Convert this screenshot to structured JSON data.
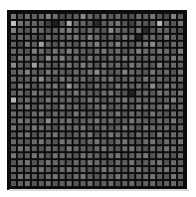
{
  "chart_data": {
    "type": "heatmap",
    "title": "",
    "xlabel": "",
    "ylabel": "",
    "rows": 25,
    "cols": 25,
    "value_range": [
      0,
      1
    ],
    "colormap": "grayscale",
    "background_color": "#0c0c0c",
    "values": [
      [
        0.45,
        0.3,
        0.4,
        0.35,
        0.38,
        0.5,
        0.42,
        0.25,
        0.3,
        0.35,
        0.55,
        0.4,
        0.3,
        0.45,
        0.32,
        0.38,
        0.3,
        0.28,
        0.4,
        0.35,
        0.45,
        0.3,
        0.25,
        0.5,
        0.35
      ],
      [
        0.8,
        0.45,
        0.4,
        0.38,
        0.35,
        0.2,
        0.05,
        0.3,
        0.7,
        0.4,
        0.38,
        0.3,
        0.1,
        0.35,
        0.4,
        0.45,
        0.3,
        0.2,
        0.4,
        0.3,
        0.35,
        0.75,
        0.4,
        0.3,
        0.45
      ],
      [
        0.5,
        0.35,
        0.3,
        0.45,
        0.4,
        0.3,
        0.35,
        0.45,
        0.5,
        0.38,
        0.3,
        0.4,
        0.35,
        0.3,
        0.55,
        0.4,
        0.35,
        0.3,
        0.45,
        0.1,
        0.3,
        0.4,
        0.35,
        0.3,
        0.25
      ],
      [
        0.3,
        0.4,
        0.35,
        0.3,
        0.25,
        0.4,
        0.3,
        0.35,
        0.4,
        0.45,
        0.35,
        0.5,
        0.4,
        0.3,
        0.35,
        0.3,
        0.45,
        0.4,
        0.05,
        0.35,
        0.4,
        0.3,
        0.45,
        0.35,
        0.3
      ],
      [
        0.35,
        0.25,
        0.45,
        0.35,
        0.65,
        0.35,
        0.3,
        0.4,
        0.35,
        0.3,
        0.45,
        0.4,
        0.5,
        0.35,
        0.4,
        0.5,
        0.35,
        0.3,
        0.4,
        0.45,
        0.55,
        0.35,
        0.3,
        0.4,
        0.35
      ],
      [
        0.4,
        0.35,
        0.3,
        0.5,
        0.4,
        0.3,
        0.45,
        0.35,
        0.5,
        0.4,
        0.35,
        0.3,
        0.4,
        0.45,
        0.35,
        0.4,
        0.3,
        0.35,
        0.5,
        0.4,
        0.35,
        0.45,
        0.4,
        0.3,
        0.5
      ],
      [
        0.3,
        0.45,
        0.4,
        0.35,
        0.3,
        0.55,
        0.4,
        0.5,
        0.35,
        0.4,
        0.3,
        0.45,
        0.35,
        0.3,
        0.4,
        0.35,
        0.45,
        0.4,
        0.3,
        0.35,
        0.4,
        0.3,
        0.35,
        0.45,
        0.4
      ],
      [
        0.55,
        0.35,
        0.3,
        0.65,
        0.4,
        0.35,
        0.3,
        0.4,
        0.45,
        0.35,
        0.5,
        0.4,
        0.3,
        0.45,
        0.35,
        0.4,
        0.3,
        0.45,
        0.4,
        0.35,
        0.3,
        0.5,
        0.35,
        0.4,
        0.35
      ],
      [
        0.35,
        0.4,
        0.5,
        0.35,
        0.3,
        0.45,
        0.4,
        0.35,
        0.3,
        0.4,
        0.35,
        0.45,
        0.55,
        0.4,
        0.3,
        0.35,
        0.5,
        0.4,
        0.35,
        0.3,
        0.45,
        0.35,
        0.4,
        0.3,
        0.45
      ],
      [
        0.4,
        0.3,
        0.35,
        0.4,
        0.55,
        0.35,
        0.3,
        0.45,
        0.4,
        0.35,
        0.4,
        0.3,
        0.35,
        0.4,
        0.45,
        0.3,
        0.35,
        0.4,
        0.3,
        0.45,
        0.35,
        0.4,
        0.3,
        0.35,
        0.4
      ],
      [
        0.3,
        0.45,
        0.4,
        0.3,
        0.35,
        0.4,
        0.45,
        0.3,
        0.6,
        0.4,
        0.35,
        0.3,
        0.4,
        0.35,
        0.3,
        0.45,
        0.4,
        0.35,
        0.4,
        0.3,
        0.55,
        0.35,
        0.45,
        0.4,
        0.3
      ],
      [
        0.35,
        0.4,
        0.3,
        0.45,
        0.4,
        0.3,
        0.35,
        0.4,
        0.35,
        0.45,
        0.4,
        0.35,
        0.3,
        0.4,
        0.45,
        0.35,
        0.3,
        0.05,
        0.35,
        0.4,
        0.3,
        0.45,
        0.4,
        0.35,
        0.45
      ],
      [
        0.75,
        0.35,
        0.4,
        0.35,
        0.3,
        0.45,
        0.4,
        0.35,
        0.4,
        0.3,
        0.35,
        0.45,
        0.4,
        0.3,
        0.35,
        0.4,
        0.45,
        0.35,
        0.4,
        0.35,
        0.4,
        0.3,
        0.35,
        0.5,
        0.35
      ],
      [
        0.3,
        0.4,
        0.45,
        0.3,
        0.4,
        0.35,
        0.3,
        0.45,
        0.35,
        0.4,
        0.3,
        0.35,
        0.4,
        0.45,
        0.3,
        0.35,
        0.4,
        0.3,
        0.45,
        0.4,
        0.35,
        0.4,
        0.45,
        0.3,
        0.4
      ],
      [
        0.4,
        0.35,
        0.3,
        0.4,
        0.45,
        0.3,
        0.4,
        0.35,
        0.3,
        0.45,
        0.4,
        0.3,
        0.35,
        0.4,
        0.35,
        0.45,
        0.3,
        0.4,
        0.35,
        0.3,
        0.45,
        0.35,
        0.3,
        0.4,
        0.35
      ],
      [
        0.35,
        0.45,
        0.4,
        0.35,
        0.3,
        0.55,
        0.35,
        0.4,
        0.45,
        0.3,
        0.35,
        0.4,
        0.45,
        0.35,
        0.4,
        0.3,
        0.35,
        0.45,
        0.4,
        0.35,
        0.3,
        0.4,
        0.35,
        0.45,
        0.3
      ],
      [
        0.45,
        0.3,
        0.35,
        0.45,
        0.4,
        0.35,
        0.3,
        0.4,
        0.35,
        0.4,
        0.45,
        0.3,
        0.35,
        0.4,
        0.3,
        0.35,
        0.45,
        0.4,
        0.3,
        0.45,
        0.4,
        0.35,
        0.4,
        0.3,
        0.4
      ],
      [
        0.3,
        0.4,
        0.45,
        0.3,
        0.35,
        0.4,
        0.45,
        0.35,
        0.3,
        0.35,
        0.4,
        0.45,
        0.3,
        0.35,
        0.45,
        0.4,
        0.35,
        0.3,
        0.4,
        0.35,
        0.3,
        0.45,
        0.35,
        0.4,
        0.35
      ],
      [
        0.4,
        0.35,
        0.3,
        0.4,
        0.45,
        0.35,
        0.3,
        0.45,
        0.4,
        0.35,
        0.3,
        0.4,
        0.45,
        0.35,
        0.3,
        0.4,
        0.45,
        0.35,
        0.3,
        0.4,
        0.45,
        0.3,
        0.4,
        0.35,
        0.45
      ],
      [
        0.35,
        0.45,
        0.4,
        0.35,
        0.3,
        0.4,
        0.35,
        0.3,
        0.45,
        0.4,
        0.35,
        0.3,
        0.4,
        0.45,
        0.35,
        0.3,
        0.4,
        0.45,
        0.35,
        0.3,
        0.4,
        0.35,
        0.45,
        0.4,
        0.3
      ],
      [
        0.45,
        0.3,
        0.35,
        0.45,
        0.4,
        0.3,
        0.45,
        0.4,
        0.35,
        0.3,
        0.45,
        0.4,
        0.35,
        0.3,
        0.4,
        0.45,
        0.3,
        0.35,
        0.4,
        0.45,
        0.3,
        0.4,
        0.35,
        0.3,
        0.4
      ],
      [
        0.3,
        0.4,
        0.45,
        0.3,
        0.35,
        0.45,
        0.4,
        0.35,
        0.3,
        0.4,
        0.35,
        0.45,
        0.4,
        0.35,
        0.3,
        0.4,
        0.35,
        0.45,
        0.3,
        0.35,
        0.4,
        0.45,
        0.3,
        0.4,
        0.35
      ],
      [
        0.4,
        0.35,
        0.3,
        0.4,
        0.45,
        0.35,
        0.3,
        0.4,
        0.45,
        0.35,
        0.4,
        0.3,
        0.35,
        0.45,
        0.4,
        0.35,
        0.3,
        0.4,
        0.45,
        0.35,
        0.3,
        0.4,
        0.45,
        0.35,
        0.4
      ],
      [
        0.35,
        0.45,
        0.4,
        0.35,
        0.3,
        0.4,
        0.45,
        0.35,
        0.3,
        0.4,
        0.45,
        0.35,
        0.3,
        0.4,
        0.35,
        0.45,
        0.4,
        0.3,
        0.35,
        0.4,
        0.45,
        0.35,
        0.3,
        0.45,
        0.35
      ],
      [
        0.3,
        0.35,
        0.4,
        0.3,
        0.35,
        0.4,
        0.3,
        0.35,
        0.4,
        0.3,
        0.35,
        0.4,
        0.3,
        0.35,
        0.4,
        0.3,
        0.35,
        0.4,
        0.3,
        0.35,
        0.4,
        0.3,
        0.35,
        0.4,
        0.3
      ]
    ]
  }
}
